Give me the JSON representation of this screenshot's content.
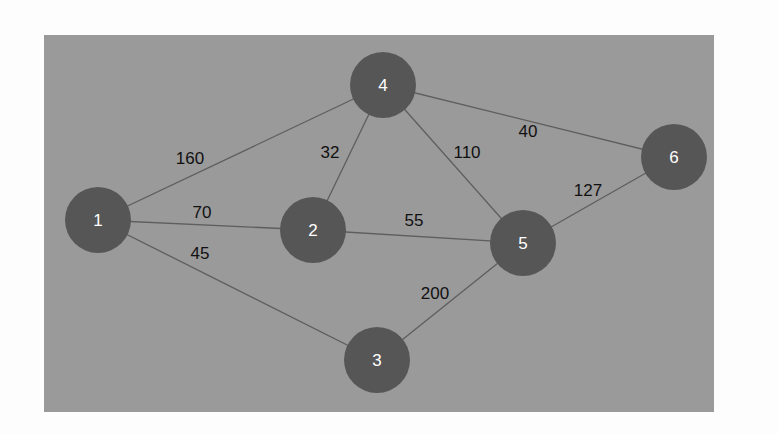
{
  "diagram": {
    "type": "weighted-undirected-graph",
    "background_color": "#9a9a9a",
    "node_color": "#565656",
    "node_label_color": "#ffffff",
    "edge_color": "#5e5e5e",
    "edge_label_color": "#111111",
    "nodes": [
      {
        "id": "1",
        "label": "1",
        "x": 98,
        "y": 220
      },
      {
        "id": "2",
        "label": "2",
        "x": 313,
        "y": 230
      },
      {
        "id": "3",
        "label": "3",
        "x": 377,
        "y": 360
      },
      {
        "id": "4",
        "label": "4",
        "x": 383,
        "y": 85
      },
      {
        "id": "5",
        "label": "5",
        "x": 523,
        "y": 243
      },
      {
        "id": "6",
        "label": "6",
        "x": 674,
        "y": 157
      }
    ],
    "edges": [
      {
        "from": "1",
        "to": "4",
        "weight": "160",
        "lx": 190,
        "ly": 158
      },
      {
        "from": "1",
        "to": "2",
        "weight": "70",
        "lx": 202,
        "ly": 212
      },
      {
        "from": "1",
        "to": "3",
        "weight": "45",
        "lx": 200,
        "ly": 253
      },
      {
        "from": "2",
        "to": "4",
        "weight": "32",
        "lx": 330,
        "ly": 152
      },
      {
        "from": "2",
        "to": "5",
        "weight": "55",
        "lx": 414,
        "ly": 220
      },
      {
        "from": "4",
        "to": "5",
        "weight": "110",
        "lx": 467,
        "ly": 152
      },
      {
        "from": "4",
        "to": "6",
        "weight": "40",
        "lx": 528,
        "ly": 131
      },
      {
        "from": "5",
        "to": "6",
        "weight": "127",
        "lx": 588,
        "ly": 190
      },
      {
        "from": "3",
        "to": "5",
        "weight": "200",
        "lx": 435,
        "ly": 293
      }
    ]
  }
}
